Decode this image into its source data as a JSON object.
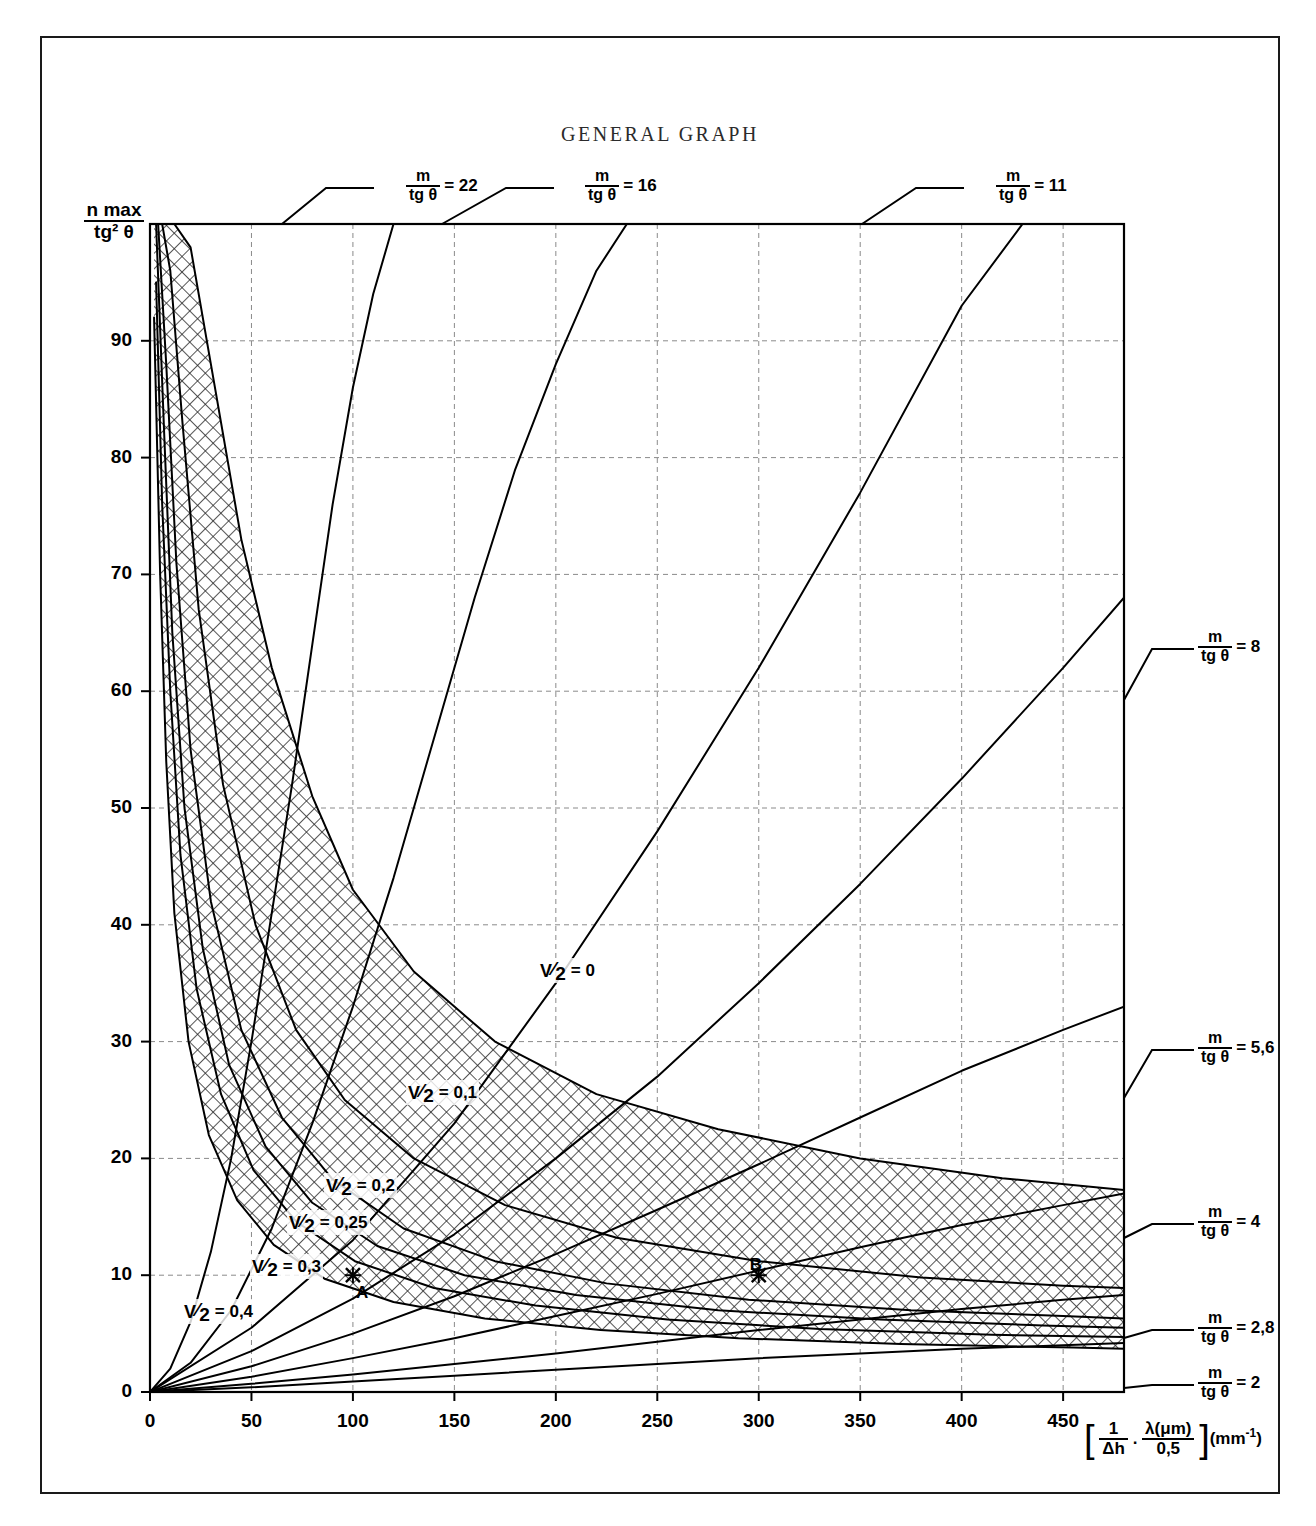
{
  "title": "GENERAL GRAPH",
  "axes": {
    "y_label_num": "n max",
    "y_label_den": "tg² θ",
    "x_label_full": "[ 1/Δh . λ(μm)/0,5 ] (mm⁻¹)",
    "x_label_parts": {
      "bracket_open": "[",
      "f1_num": "1",
      "f1_den": "Δh",
      "dot": ".",
      "f2_num": "λ(μm)",
      "f2_den": "0,5",
      "bracket_close": "]",
      "unit_open": "(mm",
      "unit_exp": "-1",
      "unit_close": ")"
    },
    "x_ticks": [
      "0",
      "50",
      "100",
      "150",
      "200",
      "250",
      "300",
      "350",
      "400",
      "450"
    ],
    "x_tick_values": [
      0,
      50,
      100,
      150,
      200,
      250,
      300,
      350,
      400,
      450
    ],
    "y_ticks": [
      "0",
      "10",
      "20",
      "30",
      "40",
      "50",
      "60",
      "70",
      "80",
      "90"
    ],
    "y_tick_values": [
      0,
      10,
      20,
      30,
      40,
      50,
      60,
      70,
      80,
      90
    ],
    "xlim": [
      0,
      480
    ],
    "ylim": [
      0,
      100
    ],
    "grid": true
  },
  "m_curves": [
    {
      "id": "m22",
      "label_num": "m",
      "label_den": "tg θ",
      "eq": "= 22",
      "value": 22,
      "label_x": 404,
      "label_y": 150,
      "leader": "top"
    },
    {
      "id": "m16",
      "label_num": "m",
      "label_den": "tg θ",
      "eq": "= 16",
      "value": 16,
      "label_x": 583,
      "label_y": 150,
      "leader": "top"
    },
    {
      "id": "m11",
      "label_num": "m",
      "label_den": "tg θ",
      "eq": "= 11",
      "value": 11,
      "label_x": 994,
      "label_y": 150,
      "leader": "top"
    },
    {
      "id": "m8",
      "label_num": "m",
      "label_den": "tg θ",
      "eq": "= 8",
      "value": 8,
      "label_x": 1196,
      "label_y": 611,
      "leader": "right"
    },
    {
      "id": "m56",
      "label_num": "m",
      "label_den": "tg θ",
      "eq": "= 5,6",
      "value": 5.6,
      "label_x": 1196,
      "label_y": 1012,
      "leader": "right"
    },
    {
      "id": "m4",
      "label_num": "m",
      "label_den": "tg θ",
      "eq": "= 4",
      "value": 4,
      "label_x": 1196,
      "label_y": 1186,
      "leader": "right"
    },
    {
      "id": "m28",
      "label_num": "m",
      "label_den": "tg θ",
      "eq": "= 2,8",
      "value": 2.8,
      "label_x": 1196,
      "label_y": 1292,
      "leader": "right"
    },
    {
      "id": "m2",
      "label_num": "m",
      "label_den": "tg θ",
      "eq": "= 2",
      "value": 2,
      "label_x": 1196,
      "label_y": 1347,
      "leader": "right"
    }
  ],
  "v_curves": [
    {
      "id": "v0",
      "num": "V",
      "den": "2",
      "eq": "= 0",
      "value": 0,
      "label_x": 536,
      "label_y": 940
    },
    {
      "id": "v01",
      "num": "V",
      "den": "2",
      "eq": "= 0,1",
      "value": 0.1,
      "label_x": 404,
      "label_y": 1062
    },
    {
      "id": "v02",
      "num": "V",
      "den": "2",
      "eq": "= 0,2",
      "value": 0.2,
      "label_x": 322,
      "label_y": 1155
    },
    {
      "id": "v025",
      "num": "V",
      "den": "2",
      "eq": "= 0,25",
      "value": 0.25,
      "label_x": 285,
      "label_y": 1192
    },
    {
      "id": "v03",
      "num": "V",
      "den": "2",
      "eq": "= 0,3",
      "value": 0.3,
      "label_x": 248,
      "label_y": 1236
    },
    {
      "id": "v04",
      "num": "V",
      "den": "2",
      "eq": "= 0,4",
      "value": 0.4,
      "label_x": 180,
      "label_y": 1281
    }
  ],
  "markers": [
    {
      "id": "A",
      "label": "A",
      "x": 100,
      "y": 10,
      "label_dx": 8,
      "label_dy": 16
    },
    {
      "id": "B",
      "label": "B",
      "x": 300,
      "y": 10,
      "label_dx": -4,
      "label_dy": -12
    }
  ],
  "colors": {
    "ink": "#000000",
    "frame": "#1a1a1a",
    "grid": "#888888",
    "hatch": "#2a2a2a",
    "background": "#ffffff"
  },
  "chart_data": {
    "type": "line",
    "title": "GENERAL GRAPH",
    "xlabel": "[ 1/Δh . λ(μm)/0,5 ] (mm⁻¹)",
    "ylabel": "n max / tg² θ",
    "xlim": [
      0,
      480
    ],
    "ylim": [
      0,
      100
    ],
    "grid": true,
    "legend": "inline-labels",
    "series": [
      {
        "name": "m/tgθ = 22",
        "family": "m",
        "value": 22,
        "x": [
          0,
          10,
          20,
          30,
          40,
          50,
          60,
          70,
          80,
          90,
          100,
          110,
          120
        ],
        "y": [
          0,
          2.0,
          6.0,
          12.0,
          20.0,
          30.0,
          41.0,
          52.0,
          64.0,
          76.0,
          86.0,
          94.0,
          100.0
        ]
      },
      {
        "name": "m/tgθ = 16",
        "family": "m",
        "value": 16,
        "x": [
          0,
          20,
          40,
          60,
          80,
          100,
          120,
          140,
          160,
          180,
          200,
          220,
          235
        ],
        "y": [
          0,
          2.5,
          7.0,
          14.0,
          23.0,
          33.0,
          44.0,
          56.0,
          68.0,
          79.0,
          88.0,
          96.0,
          100.0
        ]
      },
      {
        "name": "m/tgθ = 11",
        "family": "m",
        "value": 11,
        "x": [
          0,
          50,
          100,
          150,
          200,
          250,
          300,
          350,
          400,
          430
        ],
        "y": [
          0,
          5.5,
          13.0,
          23.0,
          35.0,
          48.0,
          62.0,
          77.0,
          93.0,
          100.0
        ]
      },
      {
        "name": "m/tgθ = 8",
        "family": "m",
        "value": 8,
        "x": [
          0,
          50,
          100,
          150,
          200,
          250,
          300,
          350,
          400,
          450,
          480
        ],
        "y": [
          0,
          3.5,
          8.0,
          13.5,
          20.0,
          27.0,
          35.0,
          43.5,
          52.5,
          62.0,
          68.0
        ]
      },
      {
        "name": "m/tgθ = 5,6",
        "family": "m",
        "value": 5.6,
        "x": [
          0,
          50,
          100,
          150,
          200,
          250,
          300,
          350,
          400,
          450,
          480
        ],
        "y": [
          0,
          2.2,
          5.0,
          8.2,
          11.8,
          15.6,
          19.5,
          23.5,
          27.5,
          31.0,
          33.0
        ]
      },
      {
        "name": "m/tgθ = 4",
        "family": "m",
        "value": 4,
        "x": [
          0,
          50,
          100,
          150,
          200,
          250,
          300,
          350,
          400,
          450,
          480
        ],
        "y": [
          0,
          1.3,
          2.9,
          4.6,
          6.5,
          8.4,
          10.4,
          12.4,
          14.3,
          16.0,
          17.0
        ]
      },
      {
        "name": "m/tgθ = 2,8",
        "family": "m",
        "value": 2.8,
        "x": [
          0,
          50,
          100,
          150,
          200,
          250,
          300,
          350,
          400,
          450,
          480
        ],
        "y": [
          0,
          0.7,
          1.5,
          2.4,
          3.3,
          4.3,
          5.3,
          6.2,
          7.1,
          7.9,
          8.3
        ]
      },
      {
        "name": "m/tgθ = 2",
        "family": "m",
        "value": 2,
        "x": [
          0,
          50,
          100,
          150,
          200,
          250,
          300,
          350,
          400,
          450,
          480
        ],
        "y": [
          0,
          0.4,
          0.9,
          1.4,
          1.9,
          2.4,
          2.9,
          3.3,
          3.7,
          4.0,
          4.2
        ]
      },
      {
        "name": "V/2 = 0",
        "family": "V",
        "value": 0,
        "x": [
          8,
          12,
          20,
          30,
          45,
          60,
          80,
          100,
          130,
          170,
          220,
          280,
          350,
          420,
          480
        ],
        "y": [
          100,
          100,
          98,
          88,
          73,
          62,
          51,
          43,
          36,
          30,
          25.5,
          22.5,
          20.0,
          18.3,
          17.3
        ]
      },
      {
        "name": "V/2 = 0,1",
        "family": "V",
        "value": 0.1,
        "x": [
          6,
          10,
          16,
          24,
          36,
          52,
          72,
          96,
          130,
          175,
          230,
          300,
          380,
          450,
          480
        ],
        "y": [
          100,
          96,
          83,
          67,
          52,
          40,
          31,
          25,
          20,
          16.0,
          13.2,
          11.2,
          9.8,
          9.1,
          8.9
        ]
      },
      {
        "name": "V/2 = 0,2",
        "family": "V",
        "value": 0.2,
        "x": [
          4,
          8,
          13,
          20,
          30,
          45,
          65,
          90,
          125,
          170,
          225,
          295,
          375,
          450,
          480
        ],
        "y": [
          100,
          88,
          71,
          55,
          42,
          31,
          23.5,
          18.2,
          14.0,
          11.2,
          9.3,
          7.9,
          7.0,
          6.5,
          6.3
        ]
      },
      {
        "name": "V/2 = 0,25",
        "family": "V",
        "value": 0.25,
        "x": [
          3,
          7,
          11,
          17,
          26,
          39,
          57,
          80,
          112,
          155,
          210,
          280,
          360,
          440,
          480
        ],
        "y": [
          100,
          82,
          65,
          50,
          38,
          28,
          21,
          16.2,
          12.5,
          10.0,
          8.3,
          7.0,
          6.2,
          5.7,
          5.5
        ]
      },
      {
        "name": "V/2 = 0,3",
        "family": "V",
        "value": 0.3,
        "x": [
          3,
          6,
          10,
          15,
          23,
          35,
          51,
          72,
          101,
          140,
          190,
          255,
          330,
          415,
          480
        ],
        "y": [
          95,
          76,
          60,
          46,
          34.5,
          25.5,
          19.0,
          14.6,
          11.2,
          8.9,
          7.4,
          6.2,
          5.4,
          4.9,
          4.7
        ]
      },
      {
        "name": "V/2 = 0,4",
        "family": "V",
        "value": 0.4,
        "x": [
          2,
          5,
          8,
          12,
          19,
          29,
          43,
          61,
          86,
          120,
          165,
          222,
          290,
          370,
          455,
          480
        ],
        "y": [
          92,
          70,
          54,
          41,
          30,
          22,
          16.4,
          12.6,
          9.7,
          7.7,
          6.3,
          5.3,
          4.6,
          4.1,
          3.8,
          3.7
        ]
      }
    ],
    "annotations": [
      {
        "label": "A",
        "x": 100,
        "y": 10
      },
      {
        "label": "B",
        "x": 300,
        "y": 10
      }
    ]
  }
}
